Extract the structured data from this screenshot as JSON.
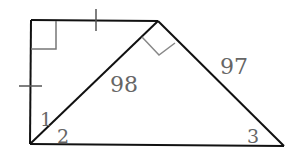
{
  "diagram": {
    "type": "geometry",
    "vertices": {
      "top_left": [
        31,
        20
      ],
      "top_right": [
        158,
        21
      ],
      "bottom_left": [
        30,
        144
      ],
      "bottom_right": [
        284,
        146
      ]
    },
    "labels": {
      "diagonal_length": "98",
      "right_side_length": "97",
      "angle_1": "1",
      "angle_2": "2",
      "angle_3": "3"
    },
    "marks": {
      "right_angle_top_left": true,
      "right_angle_top_right": true,
      "tick_top_side": 1,
      "tick_left_side": 1
    },
    "colors": {
      "line": "#111111",
      "mark": "#777777",
      "label": "#666666"
    }
  }
}
